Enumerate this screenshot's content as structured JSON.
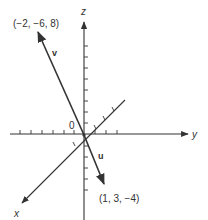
{
  "diagram": {
    "type": "3d-vector-axes",
    "axes": {
      "x_label": "x",
      "y_label": "y",
      "z_label": "z"
    },
    "origin_label": "0",
    "vectors": [
      {
        "name": "v",
        "label": "v",
        "endpoint_label": "(−2, −6, 8)",
        "components": [
          -2,
          -6,
          8
        ]
      },
      {
        "name": "u",
        "label": "u",
        "endpoint_label": "(1, 3, −4)",
        "components": [
          1,
          3,
          -4
        ]
      }
    ],
    "colors": {
      "stroke": "#333333",
      "background": "#ffffff"
    }
  }
}
